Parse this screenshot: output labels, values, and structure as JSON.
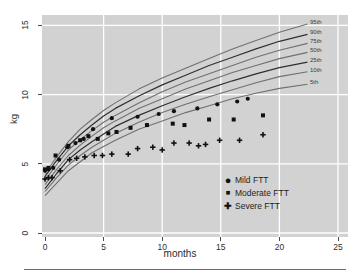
{
  "chart_data": {
    "type": "line",
    "title": "",
    "xlabel": "months",
    "ylabel": "kg",
    "xlim": [
      0,
      25
    ],
    "ylim": [
      0,
      15
    ],
    "x_ticks": [
      0,
      5,
      10,
      15,
      20,
      25
    ],
    "y_ticks": [
      0,
      5,
      10,
      15
    ],
    "grid": "white gridlines on gray background",
    "legend_position": "inside lower-right",
    "colors": {
      "plot_background": "#d2d2d2",
      "gridline": "#ffffff",
      "curve_gray": "#707070",
      "curve_dark": "#2f2f2f",
      "marker": "#111111",
      "bottom_rule": "#6b6b6b"
    },
    "percentile_months": [
      0,
      1,
      2,
      3,
      4,
      5,
      6,
      8,
      10,
      12,
      14,
      16,
      18,
      20,
      22.4
    ],
    "series": [
      {
        "name": "95th",
        "dark": false,
        "values": [
          4.3,
          5.5,
          6.6,
          7.5,
          8.2,
          8.85,
          9.4,
          10.4,
          11.2,
          11.9,
          12.6,
          13.3,
          13.9,
          14.5,
          15.1
        ]
      },
      {
        "name": "90th",
        "dark": true,
        "values": [
          4.1,
          5.25,
          6.3,
          7.1,
          7.8,
          8.45,
          9.0,
          9.9,
          10.7,
          11.4,
          12.1,
          12.7,
          13.3,
          13.85,
          14.35
        ]
      },
      {
        "name": "75th",
        "dark": false,
        "values": [
          3.8,
          4.95,
          6.0,
          6.75,
          7.4,
          8.0,
          8.5,
          9.4,
          10.2,
          10.9,
          11.5,
          12.1,
          12.7,
          13.2,
          13.7
        ]
      },
      {
        "name": "50th",
        "dark": false,
        "values": [
          3.5,
          4.6,
          5.6,
          6.35,
          7.0,
          7.6,
          8.1,
          9.0,
          9.7,
          10.4,
          11.0,
          11.6,
          12.1,
          12.6,
          13.05
        ]
      },
      {
        "name": "25th",
        "dark": true,
        "values": [
          3.2,
          4.3,
          5.3,
          6.0,
          6.6,
          7.15,
          7.7,
          8.5,
          9.2,
          9.85,
          10.45,
          11.0,
          11.5,
          11.95,
          12.35
        ]
      },
      {
        "name": "10th",
        "dark": false,
        "values": [
          3.0,
          4.0,
          4.9,
          5.6,
          6.2,
          6.7,
          7.2,
          8.0,
          8.7,
          9.3,
          9.85,
          10.35,
          10.85,
          11.3,
          11.65
        ]
      },
      {
        "name": "5th",
        "dark": false,
        "values": [
          2.7,
          3.6,
          4.5,
          5.15,
          5.8,
          6.25,
          6.7,
          7.5,
          8.1,
          8.7,
          9.2,
          9.7,
          10.1,
          10.45,
          10.75
        ]
      }
    ],
    "patients": [
      {
        "name": "Mild FTT",
        "marker": "circle",
        "marker_glyph": "●",
        "points": [
          [
            0,
            4.5
          ],
          [
            0.3,
            4.6
          ],
          [
            0.7,
            4.7
          ],
          [
            1.2,
            5.3
          ],
          [
            1.9,
            6.2
          ],
          [
            2.6,
            6.5
          ],
          [
            3.3,
            6.8
          ],
          [
            4.1,
            7.5
          ],
          [
            5.7,
            8.3
          ],
          [
            7.9,
            8.4
          ],
          [
            9.7,
            8.6
          ],
          [
            11,
            8.8
          ],
          [
            13,
            9.0
          ],
          [
            14.7,
            9.3
          ],
          [
            16.4,
            9.5
          ],
          [
            17.3,
            9.7
          ]
        ]
      },
      {
        "name": "Moderate FTT",
        "marker": "square",
        "marker_glyph": "■",
        "points": [
          [
            0,
            4.6
          ],
          [
            0.3,
            4.7
          ],
          [
            0.9,
            5.6
          ],
          [
            2.0,
            6.3
          ],
          [
            3.0,
            6.7
          ],
          [
            3.7,
            7.0
          ],
          [
            4.5,
            6.8
          ],
          [
            5.4,
            7.2
          ],
          [
            6.1,
            7.3
          ],
          [
            7.3,
            7.6
          ],
          [
            8.7,
            7.8
          ],
          [
            10.9,
            7.9
          ],
          [
            11.9,
            7.8
          ],
          [
            14,
            8.2
          ],
          [
            16.1,
            8.2
          ],
          [
            18.6,
            8.5
          ]
        ]
      },
      {
        "name": "Severe FTT",
        "marker": "plus",
        "marker_glyph": "✚",
        "points": [
          [
            0,
            3.9
          ],
          [
            0.3,
            4.0
          ],
          [
            0.6,
            4.0
          ],
          [
            1.3,
            4.5
          ],
          [
            2.1,
            5.3
          ],
          [
            2.7,
            5.4
          ],
          [
            3.4,
            5.5
          ],
          [
            4.2,
            5.6
          ],
          [
            4.9,
            5.6
          ],
          [
            5.7,
            5.7
          ],
          [
            7.1,
            5.7
          ],
          [
            7.9,
            6.1
          ],
          [
            9.2,
            6.2
          ],
          [
            10,
            6.0
          ],
          [
            11,
            6.5
          ],
          [
            12.3,
            6.5
          ],
          [
            13.1,
            6.3
          ],
          [
            13.7,
            6.4
          ],
          [
            14.9,
            6.7
          ],
          [
            16.6,
            6.7
          ],
          [
            18.6,
            7.1
          ]
        ]
      }
    ]
  }
}
